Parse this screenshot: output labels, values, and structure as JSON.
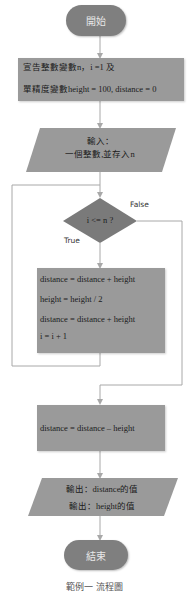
{
  "flowchart": {
    "start": {
      "label": "開始"
    },
    "declare": {
      "lines": [
        "宣告整數變數n，i =1 及",
        "單精度變數height = 100, distance = 0"
      ]
    },
    "input": {
      "lines": [
        "輸入：",
        "一個整數,並存入n"
      ]
    },
    "decision": {
      "label": "i <= n ?",
      "true_label": "True",
      "false_label": "False"
    },
    "loop_body": {
      "lines": [
        "distance = distance + height",
        "height = height / 2",
        "distance = distance + height",
        "i = i + 1"
      ]
    },
    "after_loop": {
      "lines": [
        "distance = distance – height"
      ]
    },
    "output": {
      "lines": [
        "輸出：distance的值",
        "輸出：height的值"
      ]
    },
    "end": {
      "label": "結束"
    }
  },
  "caption": "範例一 流程圖",
  "colors": {
    "terminal_fill": "#7f7f7f",
    "process_fill": "#9a9a9a",
    "decision_fill": "#7a7a7a",
    "io_fill": "#9a9a9a",
    "connector": "#a8a8a8"
  }
}
